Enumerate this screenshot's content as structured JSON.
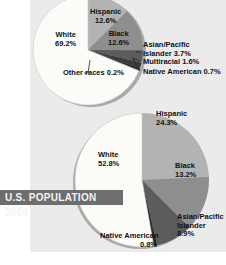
{
  "chart_data": [
    {
      "type": "pie",
      "title": "",
      "categories": [
        "Hispanic",
        "Black",
        "Asian/Pacific Islander",
        "Multiracial",
        "Native American",
        "Other races",
        "White"
      ],
      "values": [
        12.6,
        12.6,
        3.7,
        1.6,
        0.7,
        0.2,
        69.2
      ],
      "labels": {
        "hispanic": {
          "name": "Hispanic",
          "value": "12.6%"
        },
        "black": {
          "name": "Black",
          "value": "12.6%"
        },
        "asian": {
          "name": "Asian/Pacific",
          "name2": "Islander 3.7%"
        },
        "multiracial": {
          "text": "Multiracial 1.6%"
        },
        "native": {
          "text": "Native American 0.7%"
        },
        "other": {
          "text": "Other races 0.2%"
        },
        "white": {
          "name": "White",
          "value": "69.2%"
        }
      }
    },
    {
      "type": "pie",
      "title": "U.S. POPULATION 2050",
      "categories": [
        "Hispanic",
        "Black",
        "Asian/Pacific Islander",
        "Native American",
        "White"
      ],
      "values": [
        24.3,
        13.2,
        8.9,
        0.8,
        52.8
      ],
      "labels": {
        "hispanic": {
          "name": "Hispanic",
          "value": "24.3%"
        },
        "black": {
          "name": "Black",
          "value": "13.2%"
        },
        "asian": {
          "name": "Asian/Pacific",
          "name2": "Islander",
          "value": "8.9%"
        },
        "native": {
          "name": "Native American",
          "value": "0.8%"
        },
        "white": {
          "name": "White",
          "value": "52.8%"
        }
      }
    }
  ],
  "colors": {
    "white": "#fbfbf8",
    "hispanic": "#b3b3b3",
    "black": "#8e8e8e",
    "asian": "#5c5c5c",
    "multiracial": "#3a3a3a",
    "native": "#2a2a2a",
    "other": "#777777",
    "banner_bg": "#6e6e6e"
  },
  "banner": {
    "title": "U.S. POPULATION 2050"
  }
}
